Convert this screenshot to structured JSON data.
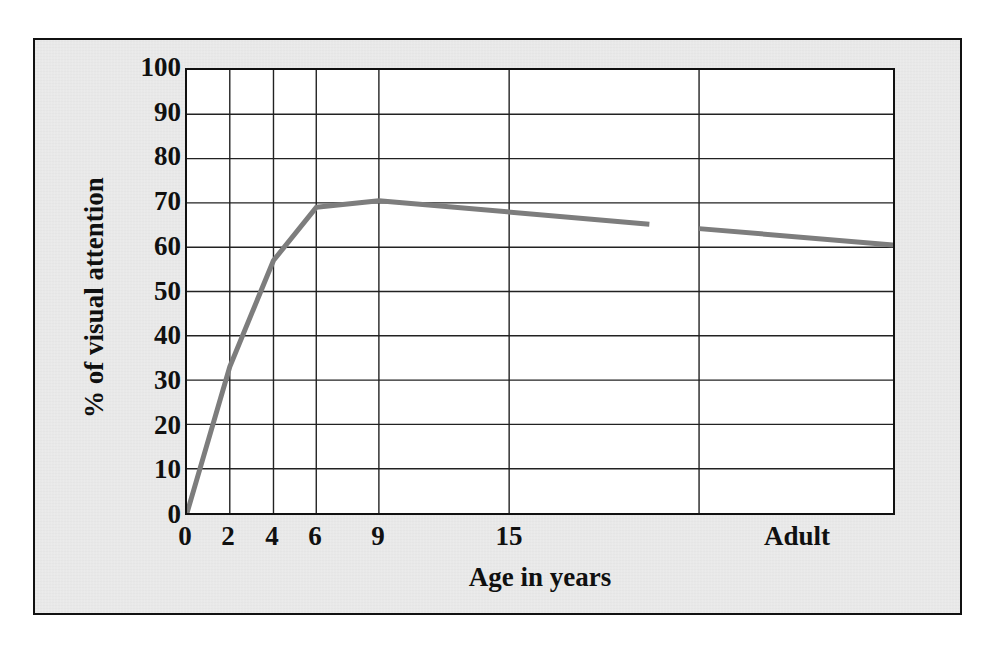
{
  "figure": {
    "background_color": "#e8e8e8",
    "plot_background_color": "#ffffff",
    "frame_color": "#111111"
  },
  "chart_data": {
    "type": "line",
    "title": "",
    "subtitle": "",
    "xlabel": "Age in years",
    "ylabel": "% of visual attention",
    "line_color": "#7d7d7d",
    "line_width": 5,
    "grid": true,
    "legend": false,
    "legend_position": "none",
    "ylim": [
      0,
      100
    ],
    "yticks": [
      0,
      10,
      20,
      30,
      40,
      50,
      60,
      70,
      80,
      90,
      100
    ],
    "ytick_labels": [
      "0",
      "10",
      "20",
      "30",
      "40",
      "50",
      "60",
      "70",
      "80",
      "90",
      "100"
    ],
    "xtick_labels": [
      "0",
      "2",
      "4",
      "6",
      "9",
      "15",
      "Adult"
    ],
    "xtick_positions_frac": [
      0.0,
      0.0606,
      0.1225,
      0.1831,
      0.2718,
      0.4563,
      0.862
    ],
    "xgrid_positions_frac": [
      0.0606,
      0.1225,
      0.1831,
      0.2718,
      0.4563,
      0.7253
    ],
    "series": [
      {
        "name": "% of visual attention",
        "segments": [
          {
            "name": "childhood-segment",
            "points": [
              {
                "x_frac": 0.0,
                "xlabel": "0",
                "value": 0
              },
              {
                "x_frac": 0.0606,
                "xlabel": "2",
                "value": 33
              },
              {
                "x_frac": 0.1225,
                "xlabel": "4",
                "value": 57
              },
              {
                "x_frac": 0.1831,
                "xlabel": "6",
                "value": 69
              },
              {
                "x_frac": 0.2718,
                "xlabel": "9",
                "value": 70.5
              },
              {
                "x_frac": 0.6549,
                "xlabel": "",
                "value": 65.2
              }
            ]
          },
          {
            "name": "adult-segment",
            "points": [
              {
                "x_frac": 0.7253,
                "xlabel": "",
                "value": 64.2
              },
              {
                "x_frac": 1.0,
                "xlabel": "Adult",
                "value": 60.5
              }
            ]
          }
        ]
      }
    ]
  }
}
